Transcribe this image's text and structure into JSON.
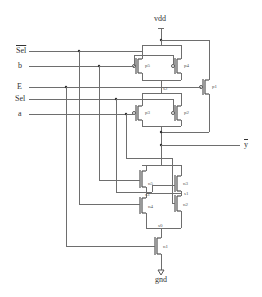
{
  "diagram": {
    "type": "CMOS transistor-level schematic",
    "supply": {
      "top": "vdd",
      "bottom": "gnd"
    },
    "inputs": [
      {
        "id": "sel_bar",
        "label": "Sel",
        "overline": true
      },
      {
        "id": "b",
        "label": "b"
      },
      {
        "id": "E",
        "label": "E"
      },
      {
        "id": "sel",
        "label": "Sel"
      },
      {
        "id": "a",
        "label": "a"
      }
    ],
    "output": {
      "label": "y",
      "overline": true
    },
    "transistors": {
      "p5": "p5",
      "p4": "p4",
      "p1": "p1",
      "p3": "p3",
      "p2": "p2",
      "n5": "n5",
      "n3": "n3",
      "n4": "n4",
      "n2": "n2",
      "n1": "n1"
    },
    "nodes": {
      "s2": "s2",
      "s1": "s1",
      "s3": "s3",
      "s0": "s0"
    }
  }
}
